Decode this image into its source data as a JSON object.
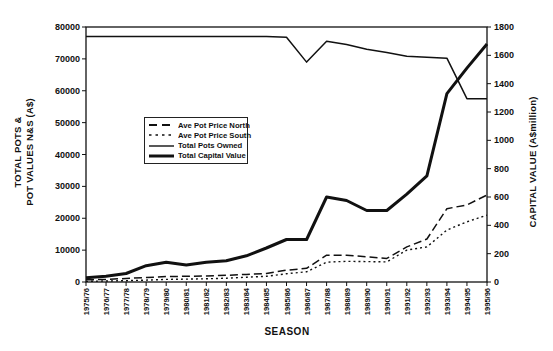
{
  "chart_data": {
    "type": "line",
    "title": "",
    "xlabel": "SEASON",
    "x_categories": [
      "1975/76",
      "1976/77",
      "1977/78",
      "1978/79",
      "1979/80",
      "1980/81",
      "1981/82",
      "1982/83",
      "1983/84",
      "1984/85",
      "1985/86",
      "1986/87",
      "1987/88",
      "1988/89",
      "1989/90",
      "1990/91",
      "1991/92",
      "1992/93",
      "1993/94",
      "1994/95",
      "1995/96"
    ],
    "left_axis": {
      "label_line1": "TOTAL POTS &",
      "label_line2": "POT VALUES N&S (A$)",
      "min": 0,
      "max": 80000,
      "tick_step": 10000,
      "ticks": [
        0,
        10000,
        20000,
        30000,
        40000,
        50000,
        60000,
        70000,
        80000
      ]
    },
    "right_axis": {
      "label": "CAPITAL VALUE (A$million)",
      "min": 0,
      "max": 1800,
      "tick_step": 200,
      "ticks": [
        0,
        200,
        400,
        600,
        800,
        1000,
        1200,
        1400,
        1600,
        1800
      ]
    },
    "grid": false,
    "legend_position": "inside-center-left",
    "series": [
      {
        "name": "Ave Pot Price North",
        "axis": "left",
        "style": "long-dash",
        "color": "#111111",
        "values": [
          700,
          800,
          1100,
          1400,
          1700,
          1800,
          1900,
          2100,
          2400,
          2700,
          3700,
          4300,
          8400,
          8400,
          7900,
          7400,
          11000,
          13500,
          23000,
          24200,
          27300
        ]
      },
      {
        "name": "Ave Pot Price South",
        "axis": "left",
        "style": "short-dash",
        "color": "#111111",
        "values": [
          200,
          300,
          400,
          600,
          800,
          900,
          1000,
          1200,
          1500,
          1800,
          2600,
          3200,
          6200,
          6500,
          6400,
          6300,
          10000,
          11000,
          16300,
          18900,
          21000
        ]
      },
      {
        "name": "Total Pots Owned",
        "axis": "left",
        "style": "solid-thin",
        "color": "#111111",
        "values": [
          77000,
          77000,
          77000,
          77000,
          77000,
          77000,
          77000,
          77000,
          77000,
          77000,
          76800,
          69000,
          75500,
          74500,
          73000,
          72000,
          70800,
          70500,
          70200,
          57500,
          57500
        ]
      },
      {
        "name": "Total Capital Value",
        "axis": "right",
        "style": "solid-thick",
        "color": "#111111",
        "values": [
          30,
          40,
          60,
          115,
          140,
          120,
          140,
          150,
          185,
          240,
          300,
          300,
          600,
          575,
          505,
          505,
          620,
          750,
          1330,
          1510,
          1680
        ]
      }
    ]
  }
}
